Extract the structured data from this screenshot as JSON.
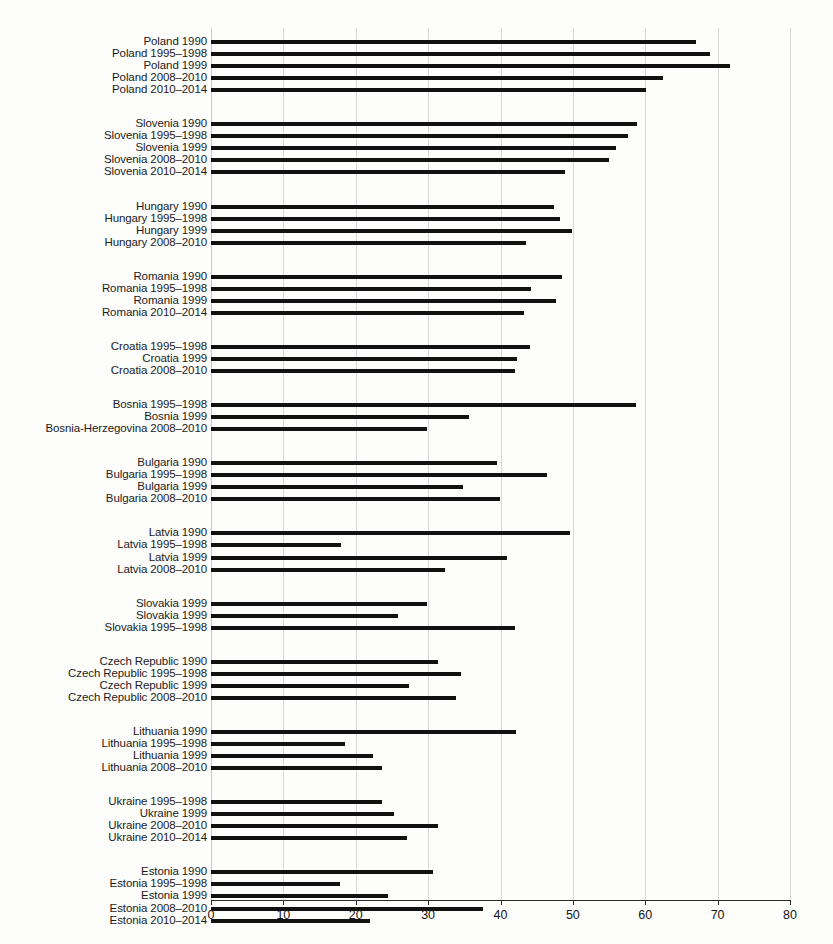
{
  "chart_data": {
    "type": "bar",
    "orientation": "horizontal",
    "title": "",
    "subtitle": "",
    "xlabel": "",
    "ylabel": "",
    "xlim": [
      0,
      80
    ],
    "ylim": null,
    "grid": true,
    "grid_axis": "x",
    "legend": null,
    "legend_position": "none",
    "xticks": [
      0,
      10,
      20,
      30,
      40,
      50,
      60,
      70,
      80
    ],
    "xtick_labels": [
      "0",
      "10",
      "20",
      "30",
      "40",
      "50",
      "60",
      "70",
      "80"
    ],
    "bar_color": "#111111",
    "grid_color": "#d9d9d9",
    "groups": [
      {
        "name": "Poland",
        "categories": [
          "Poland 1990",
          "Poland 1995–1998",
          "Poland 1999",
          "Poland 2008–2010",
          "Poland 2010–2014"
        ],
        "values": [
          67.0,
          69.0,
          71.7,
          62.4,
          60.1
        ]
      },
      {
        "name": "Slovenia",
        "categories": [
          "Slovenia 1990",
          "Slovenia 1995–1998",
          "Slovenia 1999",
          "Slovenia 2008–2010",
          "Slovenia 2010–2014"
        ],
        "values": [
          58.8,
          57.6,
          55.9,
          55.0,
          48.9
        ]
      },
      {
        "name": "Hungary",
        "categories": [
          "Hungary 1990",
          "Hungary 1995–1998",
          "Hungary 1999",
          "Hungary 2008–2010"
        ],
        "values": [
          47.4,
          48.2,
          49.9,
          43.5
        ]
      },
      {
        "name": "Romania",
        "categories": [
          "Romania 1990",
          "Romania 1995–1998",
          "Romania 1999",
          "Romania 2010–2014"
        ],
        "values": [
          48.5,
          44.2,
          47.6,
          43.2
        ]
      },
      {
        "name": "Croatia",
        "categories": [
          "Croatia 1995–1998",
          "Croatia 1999",
          "Croatia 2008–2010"
        ],
        "values": [
          44.1,
          42.3,
          42.0
        ]
      },
      {
        "name": "Bosnia",
        "categories": [
          "Bosnia 1995–1998",
          "Bosnia 1999",
          "Bosnia-Herzegovina 2008–2010"
        ],
        "values": [
          58.7,
          35.6,
          29.8
        ]
      },
      {
        "name": "Bulgaria",
        "categories": [
          "Bulgaria 1990",
          "Bulgaria 1995–1998",
          "Bulgaria 1999",
          "Bulgaria 2008–2010"
        ],
        "values": [
          39.5,
          46.4,
          34.8,
          39.9
        ]
      },
      {
        "name": "Latvia",
        "categories": [
          "Latvia 1990",
          "Latvia 1995–1998",
          "Latvia 1999",
          "Latvia 2008–2010"
        ],
        "values": [
          49.6,
          17.9,
          40.9,
          32.4
        ]
      },
      {
        "name": "Slovakia",
        "categories": [
          "Slovakia 1999",
          "Slovakia 1999",
          "Slovakia 1995–1998"
        ],
        "values": [
          29.8,
          25.8,
          42.0
        ]
      },
      {
        "name": "Czech Republic",
        "categories": [
          "Czech Republic 1990",
          "Czech Republic 1995–1998",
          "Czech Republic 1999",
          "Czech Republic 2008–2010"
        ],
        "values": [
          31.4,
          34.5,
          27.3,
          33.8
        ]
      },
      {
        "name": "Lithuania",
        "categories": [
          "Lithuania 1990",
          "Lithuania 1995–1998",
          "Lithuania 1999",
          "Lithuania 2008–2010"
        ],
        "values": [
          42.1,
          18.5,
          22.4,
          23.6
        ]
      },
      {
        "name": "Ukraine",
        "categories": [
          "Ukraine 1995–1998",
          "Ukraine 1999",
          "Ukraine 2008–2010",
          "Ukraine 2010–2014"
        ],
        "values": [
          23.6,
          25.3,
          31.4,
          27.1
        ]
      },
      {
        "name": "Estonia",
        "categories": [
          "Estonia 1990",
          "Estonia 1995–1998",
          "Estonia 1999",
          "Estonia 2008–2010",
          "Estonia 2010–2014"
        ],
        "values": [
          30.7,
          17.8,
          24.4,
          37.6,
          22.0
        ]
      }
    ]
  }
}
